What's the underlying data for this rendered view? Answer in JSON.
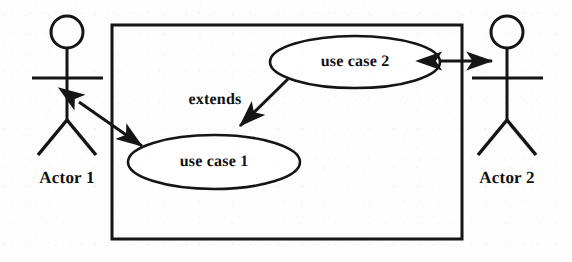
{
  "diagram": {
    "kind": "uml-use-case-diagram",
    "canvas": {
      "width": 572,
      "height": 262
    },
    "colors": {
      "stroke": "#151515",
      "text": "#111111",
      "background": "#fdfdfd"
    },
    "system_boundary": {
      "name": "system-boundary",
      "x": 112,
      "y": 25,
      "width": 350,
      "height": 214,
      "stroke_width": 3,
      "label": ""
    },
    "actors": [
      {
        "id": "actor-1",
        "label": "Actor 1",
        "side": "left",
        "head": {
          "cx": 67,
          "cy": 32,
          "r": 16
        },
        "spine": {
          "x": 67,
          "y1": 48,
          "y2": 120
        },
        "arms": {
          "y": 78,
          "x1": 32,
          "x2": 103
        },
        "legs": {
          "left": [
            38,
            155
          ],
          "right": [
            96,
            155
          ]
        },
        "label_pos": {
          "x": 67,
          "y": 178
        }
      },
      {
        "id": "actor-2",
        "label": "Actor 2",
        "side": "right",
        "head": {
          "cx": 507,
          "cy": 32,
          "r": 16
        },
        "spine": {
          "x": 507,
          "y1": 48,
          "y2": 120
        },
        "arms": {
          "y": 78,
          "x1": 472,
          "x2": 543
        },
        "legs": {
          "left": [
            478,
            155
          ],
          "right": [
            536,
            155
          ]
        },
        "label_pos": {
          "x": 507,
          "y": 178
        }
      }
    ],
    "use_cases": [
      {
        "id": "use-case-2",
        "label": "use case 2",
        "cx": 355,
        "cy": 62,
        "rx": 85,
        "ry": 26
      },
      {
        "id": "use-case-1",
        "label": "use case 1",
        "cx": 214,
        "cy": 162,
        "rx": 86,
        "ry": 27
      }
    ],
    "relationships": [
      {
        "id": "assoc-actor1-usecase1",
        "label": "",
        "type": "association",
        "arrow": "double",
        "from": "actor-1",
        "to": "use-case-1",
        "x1": 79,
        "y1": 102,
        "x2": 142,
        "y2": 146
      },
      {
        "id": "extends-usecase2-usecase1",
        "label": "extends",
        "type": "extends",
        "arrow": "single",
        "from": "use-case-2",
        "to": "use-case-1",
        "x1": 288,
        "y1": 79,
        "x2": 240,
        "y2": 126,
        "label_pos": {
          "x": 215,
          "y": 100
        }
      },
      {
        "id": "assoc-usecase2-actor2",
        "label": "",
        "type": "association",
        "arrow": "double",
        "from": "use-case-2",
        "to": "actor-2",
        "x1": 441,
        "y1": 61,
        "x2": 492,
        "y2": 61
      }
    ]
  }
}
